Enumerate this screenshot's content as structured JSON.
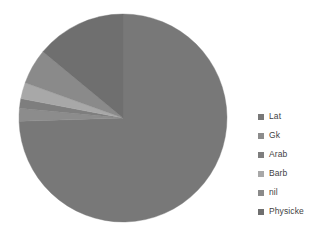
{
  "chart_data": {
    "type": "pie",
    "title": "",
    "subtitle": "",
    "xlabel": "",
    "ylabel": "",
    "grid": false,
    "legend_position": "right",
    "start_angle_deg": 0,
    "direction": "clockwise",
    "categories": [
      "Lat",
      "Gk",
      "Arab",
      "Barb",
      "nil",
      "Physicke"
    ],
    "values": [
      74.5,
      2.0,
      1.5,
      2.5,
      5.5,
      14.0
    ],
    "units": "percent",
    "slices": [
      {
        "label": "Lat",
        "value": 74.5,
        "color": "#787878"
      },
      {
        "label": "Gk",
        "value": 2.0,
        "color": "#8c8c8c"
      },
      {
        "label": "Arab",
        "value": 1.5,
        "color": "#7e7e7e"
      },
      {
        "label": "Barb",
        "value": 2.5,
        "color": "#a8a8a8"
      },
      {
        "label": "nil",
        "value": 5.5,
        "color": "#8a8a8a"
      },
      {
        "label": "Physicke",
        "value": 14.0,
        "color": "#6f6f6f"
      }
    ],
    "geometry": {
      "cx": 123,
      "cy": 118,
      "r": 104
    }
  },
  "legend": {
    "items": [
      {
        "label": "Lat",
        "color": "#787878"
      },
      {
        "label": "Gk",
        "color": "#8c8c8c"
      },
      {
        "label": "Arab",
        "color": "#7e7e7e"
      },
      {
        "label": "Barb",
        "color": "#a8a8a8"
      },
      {
        "label": "nil",
        "color": "#8a8a8a"
      },
      {
        "label": "Physicke",
        "color": "#6f6f6f"
      }
    ]
  },
  "colors": {
    "background": "#ffffff",
    "legend_text": "#3f3f3f"
  }
}
